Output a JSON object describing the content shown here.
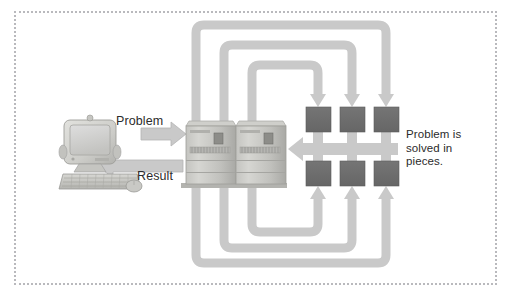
{
  "diagram": {
    "frame": {
      "style": "dotted-border",
      "color": "#b9b9bd"
    },
    "background_color": "#ffffff",
    "labels": {
      "problem": "Problem",
      "result": "Result",
      "pieces": "Problem is\nsolved in\npieces."
    },
    "nodes": {
      "workstation": {
        "name": "desktop computer",
        "parts": [
          "monitor",
          "keyboard",
          "mouse"
        ],
        "x": 62,
        "y": 118,
        "width": 80,
        "height": 74
      },
      "server": {
        "name": "server cabinets",
        "count": 2,
        "x": 183,
        "y": 122,
        "width": 102,
        "height": 64
      },
      "pieces": {
        "name": "problem pieces",
        "count": 6,
        "rows": 2,
        "cols": 3,
        "color": "#6e6e6e",
        "size": 25
      }
    },
    "arrows": {
      "problem_arrow": {
        "direction": "right",
        "label": "Problem"
      },
      "result_arrow": {
        "direction": "left",
        "label": "Result"
      },
      "return_arrow": {
        "direction": "left",
        "label": ""
      },
      "distribution_paths_top": 3,
      "distribution_paths_bottom": 3
    },
    "colors": {
      "arrow_fill": "#c9c9c9",
      "arrow_edge": "#b0b0b0",
      "piece_fill": "#6e6e6e",
      "piece_edge": "#5a5a5a",
      "text": "#2b2b2b",
      "frame": "#b9b9bd",
      "device_light": "#d8d8d4",
      "device_mid": "#bdbdb9",
      "device_dark": "#9a9a96"
    }
  }
}
